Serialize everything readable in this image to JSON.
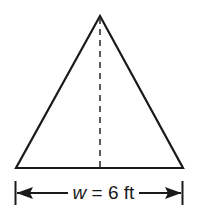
{
  "figure": {
    "shape": "isosceles-triangle",
    "line_color": "#1a1a1a",
    "apex": [
      100,
      16
    ],
    "base_left": [
      16,
      168
    ],
    "base_right": [
      183,
      168
    ],
    "height_line": "dashed"
  },
  "dimension": {
    "variable": "w",
    "equals": "=",
    "value": "6 ft",
    "full_text": "w = 6 ft"
  }
}
